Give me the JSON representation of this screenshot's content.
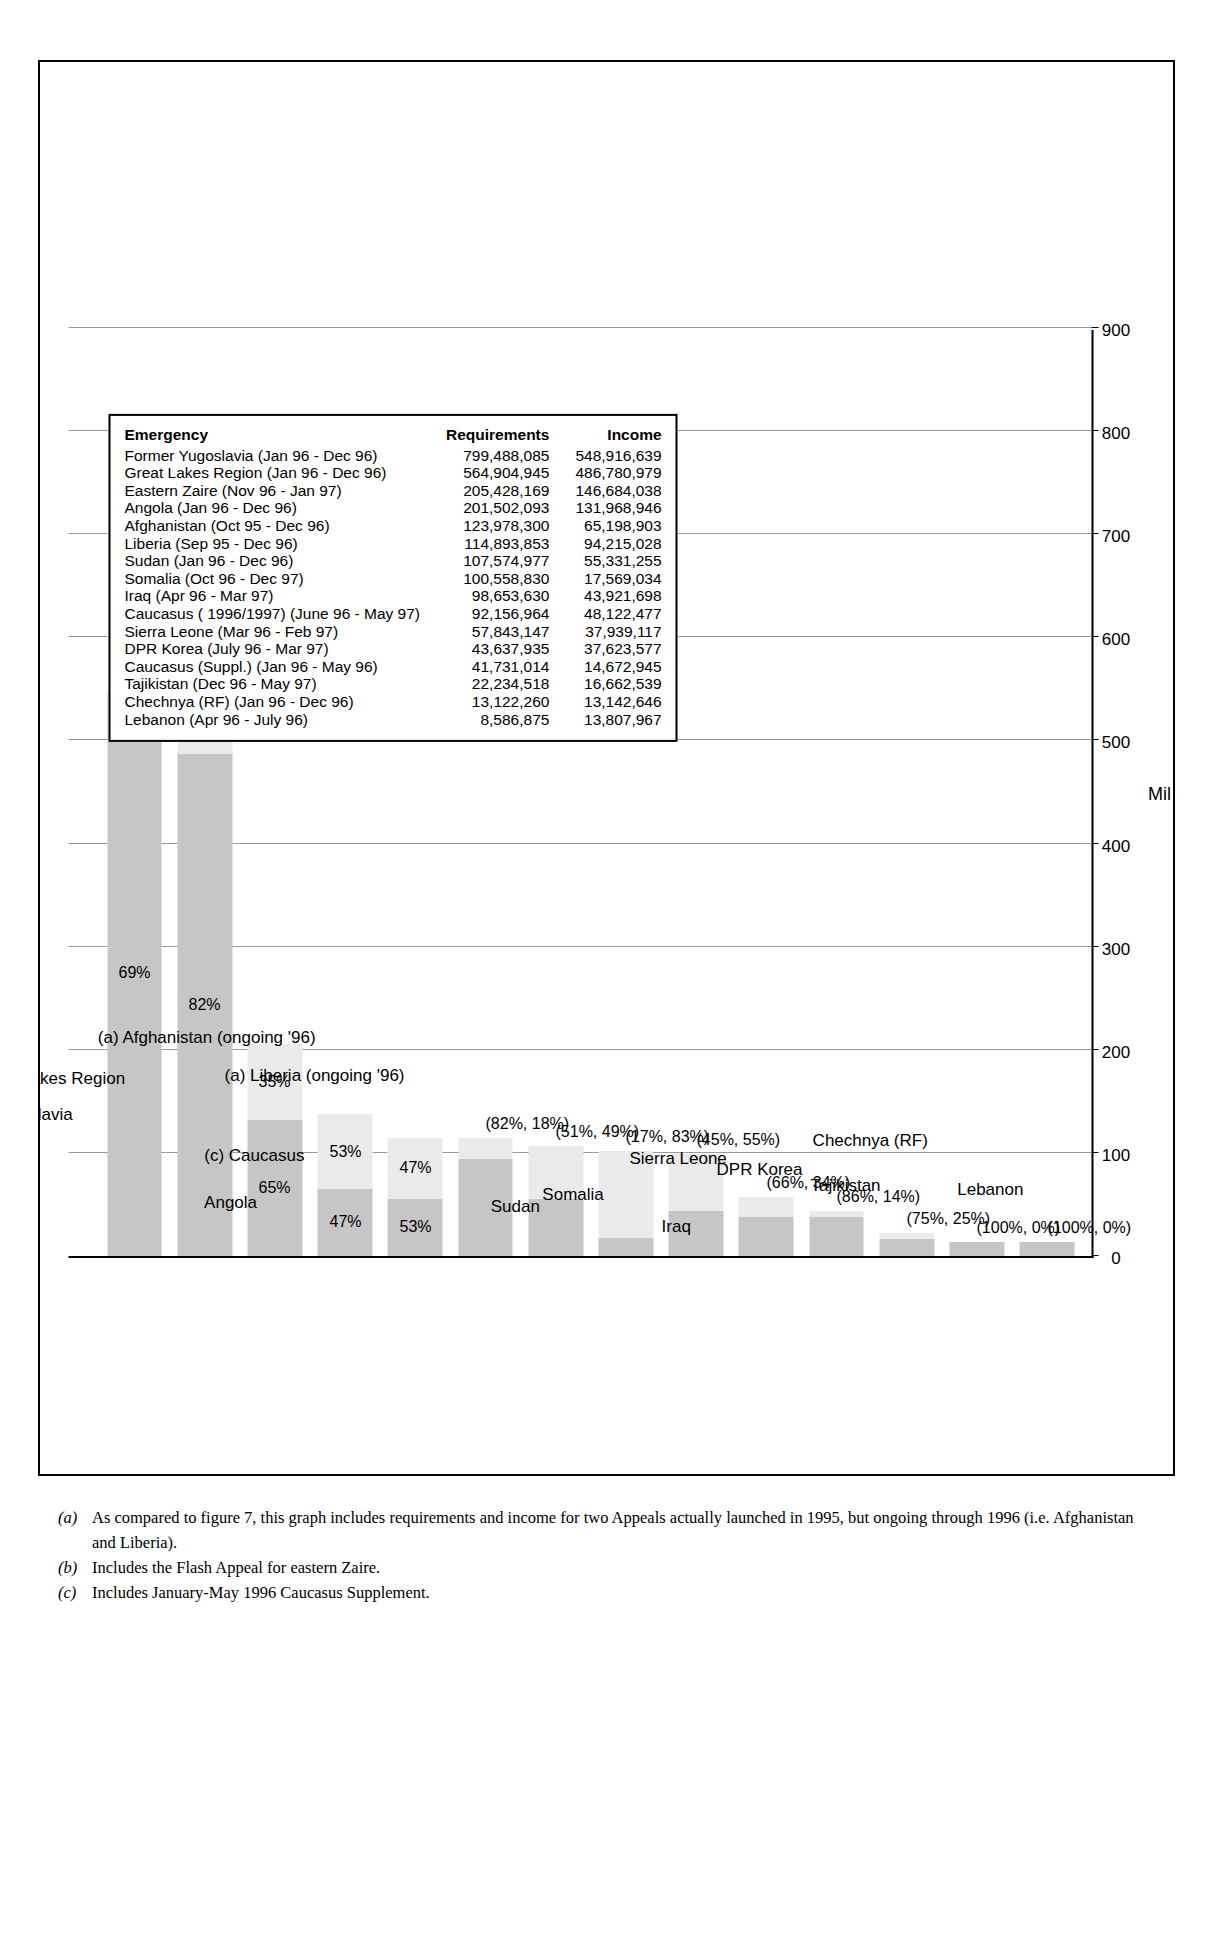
{
  "chart_data": {
    "type": "bar",
    "orientation": "horizontal-rotated",
    "title": "",
    "xlabel": "Millions",
    "ylabel": "",
    "xlim": [
      0,
      900
    ],
    "xticks": [
      0,
      100,
      200,
      300,
      400,
      500,
      600,
      700,
      800,
      900
    ],
    "grid": true,
    "legend_position": "bottom-center",
    "stack_note": "(Requirements = Income + Shortfall)",
    "categories": [
      "Former Yugoslavia",
      "(b) Great Lakes Region",
      "Angola",
      "(c) Caucasus",
      "(a) Afghanistan (ongoing '96)",
      "(a) Liberia (ongoing '96)",
      "Sudan",
      "Somalia",
      "Iraq",
      "Sierra Leone",
      "DPR Korea",
      "Tajikistan",
      "Chechnya (RF)",
      "Lebanon"
    ],
    "series": [
      {
        "name": "Income",
        "values": [
          548.917,
          486.781,
          131.969,
          65.199,
          55.331,
          94.215,
          55.331,
          17.569,
          43.922,
          37.939,
          37.624,
          16.663,
          13.143,
          13.808
        ]
      },
      {
        "name": "Shortfall",
        "values": [
          250.571,
          78.124,
          73.459,
          72.184,
          59.562,
          20.679,
          51.244,
          83.9,
          54.732,
          19.205,
          6.014,
          5.571,
          0,
          0
        ]
      }
    ],
    "bar_totals": [
      799.488,
      564.905,
      205.428,
      137.383,
      114.894,
      114.894,
      106.575,
      101.469,
      98.654,
      57.143,
      43.638,
      22.235,
      13.122,
      13.808
    ],
    "bar_labels": [
      {
        "income": "69%",
        "shortfall": "31%"
      },
      {
        "income": "82%",
        "shortfall": "18%"
      },
      {
        "income": "65%",
        "shortfall": "35%"
      },
      {
        "income": "47%",
        "shortfall": "53%"
      },
      {
        "income": "53%",
        "shortfall": "47%"
      },
      {
        "combined": "(82%, 18%)"
      },
      {
        "combined": "(51%, 49%)"
      },
      {
        "combined": "(17%, 83%)"
      },
      {
        "combined": "(45%, 55%)"
      },
      {
        "combined": "(66%, 34%)"
      },
      {
        "combined": "(86%, 14%)"
      },
      {
        "combined": "(75%, 25%)"
      },
      {
        "combined": "(100%, 0%)"
      },
      {
        "combined": "(100%, 0%)"
      }
    ],
    "colors": {
      "income": "#c6c6c6",
      "shortfall": "#eaeaea",
      "axis": "#000000",
      "grid": "#9a9a9a"
    }
  },
  "legend": {
    "items": [
      {
        "label": "Income",
        "color": "#c6c6c6"
      },
      {
        "label": "Shortfall",
        "color": "#eaeaea"
      }
    ],
    "note": "(Requirements = Income + Shortfall)"
  },
  "axis": {
    "title": "Millions",
    "ticks": [
      "0",
      "100",
      "200",
      "300",
      "400",
      "500",
      "600",
      "700",
      "800",
      "900"
    ]
  },
  "table": {
    "headers": [
      "Emergency",
      "Requirements",
      "Income"
    ],
    "rows": [
      {
        "emergency": "Former Yugoslavia (Jan 96 - Dec 96)",
        "requirements": "799,488,085",
        "income": "548,916,639"
      },
      {
        "emergency": "Great Lakes Region (Jan 96 - Dec 96)",
        "requirements": "564,904,945",
        "income": "486,780,979"
      },
      {
        "emergency": "Eastern Zaire (Nov 96 - Jan 97)",
        "requirements": "205,428,169",
        "income": "146,684,038"
      },
      {
        "emergency": "Angola (Jan 96 - Dec 96)",
        "requirements": "201,502,093",
        "income": "131,968,946"
      },
      {
        "emergency": "Afghanistan (Oct 95 - Dec 96)",
        "requirements": "123,978,300",
        "income": "65,198,903"
      },
      {
        "emergency": "Liberia (Sep 95 - Dec 96)",
        "requirements": "114,893,853",
        "income": "94,215,028"
      },
      {
        "emergency": "Sudan (Jan 96 - Dec 96)",
        "requirements": "107,574,977",
        "income": "55,331,255"
      },
      {
        "emergency": "Somalia (Oct 96 - Dec 97)",
        "requirements": "100,558,830",
        "income": "17,569,034"
      },
      {
        "emergency": "Iraq (Apr 96 - Mar 97)",
        "requirements": "98,653,630",
        "income": "43,921,698"
      },
      {
        "emergency": "Caucasus ( 1996/1997) (June 96 - May 97)",
        "requirements": "92,156,964",
        "income": "48,122,477"
      },
      {
        "emergency": "Sierra Leone (Mar 96 - Feb 97)",
        "requirements": "57,843,147",
        "income": "37,939,117"
      },
      {
        "emergency": "DPR Korea (July 96 - Mar 97)",
        "requirements": "43,637,935",
        "income": "37,623,577"
      },
      {
        "emergency": "Caucasus (Suppl.) (Jan 96 - May 96)",
        "requirements": "41,731,014",
        "income": "14,672,945"
      },
      {
        "emergency": "Tajikistan (Dec 96 - May 97)",
        "requirements": "22,234,518",
        "income": "16,662,539"
      },
      {
        "emergency": "Chechnya (RF) (Jan 96 - Dec 96)",
        "requirements": "13,122,260",
        "income": "13,142,646"
      },
      {
        "emergency": "Lebanon (Apr 96 - July 96)",
        "requirements": "8,586,875",
        "income": "13,807,967"
      }
    ]
  },
  "footnotes": [
    {
      "marker": "(a)",
      "text": "As compared to figure 7, this graph includes requirements and income for two Appeals actually launched in 1995, but ongoing through 1996 (i.e. Afghanistan and Liberia)."
    },
    {
      "marker": "(b)",
      "text": "Includes the Flash Appeal for eastern Zaire."
    },
    {
      "marker": "(c)",
      "text": "Includes January-May 1996 Caucasus Supplement."
    }
  ]
}
